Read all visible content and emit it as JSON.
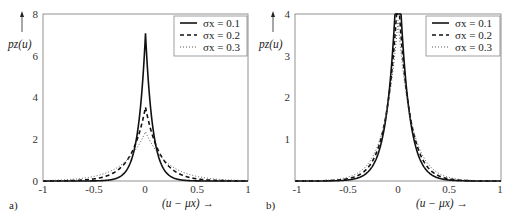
{
  "figure": {
    "panels": [
      "a)",
      "b)"
    ]
  },
  "chart_data": [
    {
      "type": "line",
      "panel_label": "a)",
      "title": "",
      "xlabel": "(u − μx) →",
      "ylabel": "pz(u)",
      "xlim": [
        -1,
        1
      ],
      "ylim": [
        0,
        8
      ],
      "xticks": [
        "-1",
        "-0.5",
        "0",
        "0.5",
        "1"
      ],
      "yticks": [
        "0",
        "2",
        "4",
        "6",
        "8"
      ],
      "grid": false,
      "legend_position": "upper right",
      "legend": [
        "σx = 0.1",
        "σx = 0.2",
        "σx = 0.3"
      ],
      "series": [
        {
          "name": "σx = 0.1",
          "style": "solid",
          "peak": 7.07,
          "scale": 0.0707
        },
        {
          "name": "σx = 0.2",
          "style": "dashed",
          "peak": 3.54,
          "scale": 0.1414
        },
        {
          "name": "σx = 0.3",
          "style": "dotted",
          "peak": 2.36,
          "scale": 0.2121
        }
      ],
      "x": [
        -1,
        -0.75,
        -0.5,
        -0.3,
        -0.2,
        -0.1,
        -0.05,
        0,
        0.05,
        0.1,
        0.2,
        0.3,
        0.5,
        0.75,
        1
      ],
      "values": {
        "σx = 0.1": [
          0.0,
          0.0,
          0.006,
          0.1,
          0.42,
          1.72,
          3.49,
          7.07,
          3.49,
          1.72,
          0.42,
          0.1,
          0.006,
          0.0,
          0.0
        ],
        "σx = 0.2": [
          0.003,
          0.02,
          0.1,
          0.42,
          0.86,
          1.75,
          2.49,
          3.54,
          2.49,
          1.75,
          0.86,
          0.42,
          0.1,
          0.02,
          0.003
        ],
        "σx = 0.3": [
          0.02,
          0.07,
          0.22,
          0.57,
          0.92,
          1.47,
          1.86,
          2.36,
          1.86,
          1.47,
          0.92,
          0.57,
          0.22,
          0.07,
          0.02
        ]
      }
    },
    {
      "type": "line",
      "panel_label": "b)",
      "title": "",
      "xlabel": "(u − μx) →",
      "ylabel": "pz(u)",
      "xlim": [
        -1,
        1
      ],
      "ylim": [
        0,
        4
      ],
      "xticks": [
        "-1",
        "-0.5",
        "0",
        "0.5",
        "1"
      ],
      "yticks": [
        "1",
        "2",
        "3",
        "4"
      ],
      "grid": false,
      "legend_position": "upper right",
      "legend": [
        "σx = 0.1",
        "σx = 0.2",
        "σx = 0.3"
      ],
      "series": [
        {
          "name": "σx = 0.1",
          "style": "solid"
        },
        {
          "name": "σx = 0.2",
          "style": "dashed"
        },
        {
          "name": "σx = 0.3",
          "style": "dotted"
        }
      ],
      "x": [
        -1,
        -0.75,
        -0.5,
        -0.3,
        -0.2,
        -0.1,
        -0.05,
        0,
        0.05,
        0.1,
        0.2,
        0.3,
        0.5,
        0.75,
        1
      ],
      "values": {
        "σx = 0.1": [
          0.0,
          0.0,
          0.01,
          0.1,
          0.35,
          1.2,
          2.6,
          4.0,
          2.6,
          1.2,
          0.35,
          0.1,
          0.01,
          0.0,
          0.0
        ],
        "σx = 0.2": [
          0.01,
          0.02,
          0.08,
          0.25,
          0.5,
          1.3,
          2.8,
          4.0,
          2.8,
          1.3,
          0.5,
          0.25,
          0.08,
          0.02,
          0.01
        ],
        "σx = 0.3": [
          0.02,
          0.05,
          0.13,
          0.35,
          0.62,
          1.4,
          2.95,
          4.0,
          2.95,
          1.4,
          0.62,
          0.35,
          0.13,
          0.05,
          0.02
        ]
      }
    }
  ]
}
